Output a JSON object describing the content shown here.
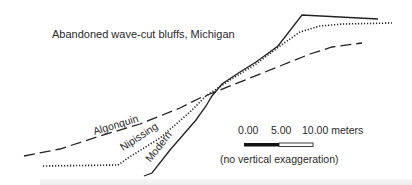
{
  "title": "Abandoned wave-cut bluffs, Michigan",
  "profiles": [
    {
      "name": "Modern",
      "style": "solid",
      "points": [
        [
          144,
          176
        ],
        [
          152,
          173
        ],
        [
          170,
          150
        ],
        [
          196,
          120
        ],
        [
          206,
          106
        ],
        [
          212,
          96
        ],
        [
          222,
          84
        ],
        [
          240,
          72
        ],
        [
          256,
          62
        ],
        [
          278,
          46
        ],
        [
          302,
          15
        ],
        [
          378,
          19
        ]
      ]
    },
    {
      "name": "Nipissing",
      "style": "dotted",
      "points": [
        [
          43,
          166
        ],
        [
          118,
          165
        ],
        [
          128,
          158
        ],
        [
          160,
          138
        ],
        [
          190,
          112
        ],
        [
          206,
          96
        ],
        [
          230,
          80
        ],
        [
          256,
          64
        ],
        [
          280,
          46
        ],
        [
          300,
          32
        ],
        [
          320,
          26
        ],
        [
          343,
          24
        ],
        [
          392,
          23
        ]
      ]
    },
    {
      "name": "Algonquin",
      "style": "dashed",
      "points": [
        [
          24,
          156
        ],
        [
          60,
          149
        ],
        [
          100,
          136
        ],
        [
          140,
          124
        ],
        [
          180,
          108
        ],
        [
          200,
          98
        ],
        [
          220,
          90
        ],
        [
          250,
          78
        ],
        [
          280,
          66
        ],
        [
          310,
          54
        ],
        [
          332,
          47
        ],
        [
          362,
          43
        ]
      ]
    }
  ],
  "labels": {
    "algonquin": "Algonquin",
    "nipissing": "Nipissing",
    "modern": "Modern"
  },
  "scale_bar": {
    "ticks": [
      "0.00",
      "5.00",
      "10.00 meters"
    ],
    "note": "(no vertical exaggeration)"
  },
  "colors": {
    "ink": "#222222",
    "background": "#ffffff"
  }
}
